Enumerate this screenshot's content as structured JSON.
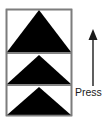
{
  "figure": {
    "name": "press-up-instruction-diagram",
    "background_color": "#ffffff",
    "width": 112,
    "height": 124
  },
  "panel": {
    "name": "segmented-panel",
    "border_color": "#7d7d7d",
    "fill_color": "#ffffff",
    "x": 6,
    "y": 9,
    "width": 66,
    "height": 107,
    "segment_count": 3,
    "divider_color": "#5a5a5a",
    "divider_y_positions": [
      53,
      85
    ]
  },
  "triangles": [
    {
      "name": "triangle-top",
      "label": "upward triangle segment 1",
      "color": "#000000",
      "apex_x": 39,
      "apex_y": 10,
      "base_y": 52,
      "left_x": 7,
      "right_x": 71
    },
    {
      "name": "triangle-middle",
      "label": "upward triangle segment 2",
      "color": "#000000",
      "apex_x": 39,
      "apex_y": 55,
      "base_y": 84,
      "left_x": 7,
      "right_x": 71
    },
    {
      "name": "triangle-bottom",
      "label": "upward triangle segment 3",
      "color": "#000000",
      "apex_x": 39,
      "apex_y": 87,
      "base_y": 115,
      "left_x": 7,
      "right_x": 71
    }
  ],
  "arrow": {
    "name": "up-arrow",
    "direction": "up",
    "color": "#1a1a1a",
    "shaft_x": 93,
    "shaft_top_y": 40,
    "shaft_bottom_y": 86,
    "head_tip_y": 29,
    "head_half_width": 4.5,
    "head_height": 11,
    "shaft_width": 1.4
  },
  "annotation": {
    "name": "press-label",
    "text": "Press",
    "color": "#1a1a1a",
    "x": 75,
    "y": 96,
    "font_size": 10.5
  }
}
